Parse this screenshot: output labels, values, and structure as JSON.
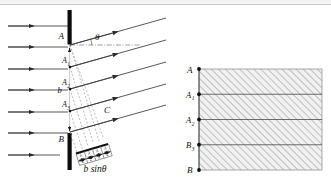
{
  "figure": {
    "title_present": false,
    "left_diagram": {
      "name": "single-slit-diffraction-ray-diagram",
      "barrier_label_top": "A",
      "barrier_label_bottom": "B",
      "slit_width_label": "b",
      "angle_label": "θ",
      "point_label_c": "C",
      "path_difference_label": "b sinθ",
      "zone_labels": [
        "A",
        "A",
        "A"
      ],
      "zone_label_subs": [
        "1",
        "2",
        "3"
      ],
      "segment_labels": [
        "λ",
        "λ",
        "λ",
        "λ"
      ],
      "segment_denominators": [
        "2",
        "2",
        "2",
        "2"
      ],
      "incoming_ray_count": 7,
      "outgoing_ray_count": 5,
      "wavefront_count": 4
    },
    "right_diagram": {
      "name": "zone-strip-diagram",
      "labels": [
        "A",
        "A",
        "A",
        "B"
      ],
      "label_subs": [
        "",
        "1",
        "2",
        "3"
      ],
      "bottom_label": "B",
      "strip_count": 4,
      "hatched": true
    },
    "colors": {
      "ink": "#101010",
      "barrier": "#0d0d0d",
      "ray": "#3a3a3a",
      "dashed": "#9a9a9a",
      "hatch": "#a9a9a9",
      "hatch_fill": "#f0f0f0",
      "top_band": "#f3f3f3"
    }
  }
}
